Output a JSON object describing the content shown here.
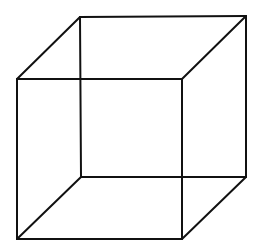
{
  "diagram": {
    "type": "wireframe-cube",
    "stroke_color": "#111111",
    "background": "#ffffff",
    "stroke_width": 2,
    "front_face": {
      "tl": [
        17,
        79
      ],
      "tr": [
        182,
        79
      ],
      "br": [
        182,
        239
      ],
      "bl": [
        17,
        239
      ]
    },
    "back_face": {
      "tl": [
        80,
        17
      ],
      "tr": [
        246,
        16
      ],
      "br": [
        246,
        177
      ],
      "bl": [
        81,
        177
      ]
    }
  }
}
